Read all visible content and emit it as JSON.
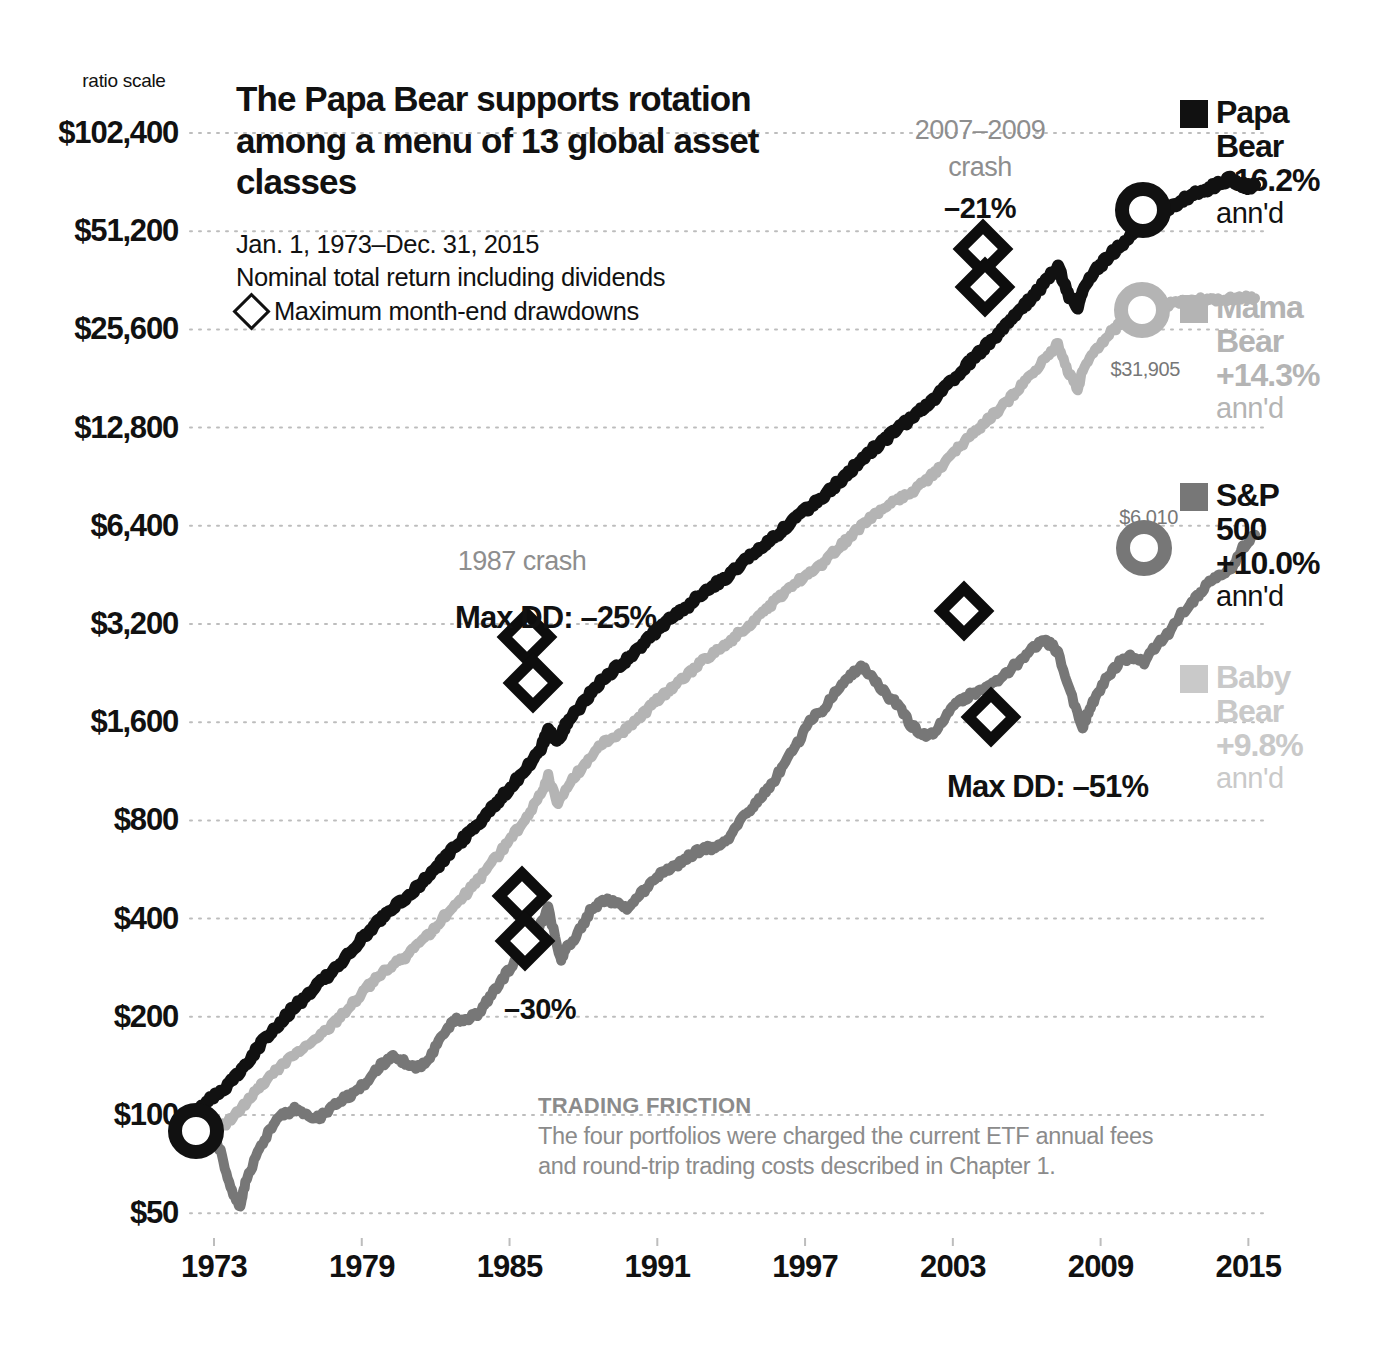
{
  "chart_data": {
    "type": "line",
    "title": "The Papa Bear supports rotation among a menu of 13 global asset classes",
    "subtitle_lines": [
      "Jan. 1, 1973–Dec. 31, 2015",
      "Nominal total return including dividends"
    ],
    "drawdown_key": "Maximum month-end drawdowns",
    "ratio_scale_label": "ratio scale",
    "xlabel": "",
    "ylabel": "",
    "grid": true,
    "log_scale": true,
    "ylim": [
      50,
      102400
    ],
    "xlim": [
      1973,
      2016
    ],
    "yticks": [
      "$102,400",
      "$51,200",
      "$25,600",
      "$12,800",
      "$6,400",
      "$3,200",
      "$1,600",
      "$800",
      "$400",
      "$200",
      "$100",
      "$50"
    ],
    "ytick_values": [
      102400,
      51200,
      25600,
      12800,
      6400,
      3200,
      1600,
      800,
      400,
      200,
      100,
      50
    ],
    "xticks": [
      "1973",
      "1979",
      "1985",
      "1991",
      "1997",
      "2003",
      "2009",
      "2015"
    ],
    "xtick_values": [
      1973,
      1979,
      1985,
      1991,
      1997,
      2003,
      2009,
      2015
    ],
    "legend_position": "right",
    "series": [
      {
        "name": "Papa Bear",
        "label_lines": [
          "Papa",
          "Bear"
        ],
        "annual_return": "+16.2%",
        "ann_suffix": "ann'd",
        "color": "#111111",
        "end_value": 71000,
        "end_value_label": "",
        "max_drawdown": "-25%",
        "x": [
          1973.0,
          1973.5,
          1974.0,
          1974.5,
          1975.0,
          1975.5,
          1976.0,
          1976.5,
          1977.0,
          1977.5,
          1978.0,
          1978.5,
          1979.0,
          1979.5,
          1980.0,
          1980.5,
          1981.0,
          1981.5,
          1982.0,
          1982.5,
          1983.0,
          1983.5,
          1984.0,
          1984.5,
          1985.0,
          1985.5,
          1986.0,
          1986.5,
          1987.0,
          1987.3,
          1987.7,
          1988.0,
          1988.5,
          1989.0,
          1989.5,
          1990.0,
          1990.5,
          1991.0,
          1991.5,
          1992.0,
          1992.5,
          1993.0,
          1993.5,
          1994.0,
          1994.5,
          1995.0,
          1995.5,
          1996.0,
          1996.5,
          1997.0,
          1997.5,
          1998.0,
          1998.5,
          1999.0,
          1999.5,
          2000.0,
          2000.5,
          2001.0,
          2001.5,
          2002.0,
          2002.5,
          2003.0,
          2003.5,
          2004.0,
          2004.5,
          2005.0,
          2005.5,
          2006.0,
          2006.5,
          2007.0,
          2007.5,
          2008.0,
          2008.4,
          2008.8,
          2009.0,
          2009.5,
          2010.0,
          2010.5,
          2011.0,
          2011.5,
          2012.0,
          2012.5,
          2013.0,
          2013.5,
          2014.0,
          2014.5,
          2015.0,
          2015.3,
          2015.7,
          2016.0
        ],
        "y": [
          100,
          112,
          118,
          128,
          142,
          160,
          178,
          196,
          214,
          232,
          252,
          274,
          300,
          330,
          365,
          400,
          432,
          462,
          500,
          545,
          600,
          660,
          720,
          790,
          870,
          960,
          1060,
          1180,
          1330,
          1500,
          1400,
          1560,
          1750,
          1950,
          2150,
          2320,
          2500,
          2720,
          2950,
          3200,
          3400,
          3650,
          3950,
          4200,
          4450,
          4800,
          5150,
          5550,
          5950,
          6400,
          6900,
          7400,
          7900,
          8600,
          9300,
          10200,
          11000,
          11800,
          12700,
          13600,
          14600,
          15800,
          17200,
          18800,
          20600,
          22500,
          24500,
          26800,
          29500,
          32500,
          36000,
          40000,
          33000,
          29500,
          33500,
          38500,
          42500,
          46000,
          50000,
          53000,
          56500,
          60000,
          63500,
          66500,
          68500,
          71500,
          74000,
          72000,
          70000,
          71000
        ]
      },
      {
        "name": "Mama Bear",
        "label_lines": [
          "Mama",
          "Bear"
        ],
        "annual_return": "+14.3%",
        "ann_suffix": "ann'd",
        "color": "#b4b4b4",
        "end_value": 31905,
        "end_value_label": "$31,905",
        "max_drawdown": "",
        "x": [
          1973.0,
          1973.5,
          1974.0,
          1974.5,
          1975.0,
          1975.5,
          1976.0,
          1976.5,
          1977.0,
          1977.5,
          1978.0,
          1978.5,
          1979.0,
          1979.5,
          1980.0,
          1980.5,
          1981.0,
          1981.5,
          1982.0,
          1982.5,
          1983.0,
          1983.5,
          1984.0,
          1984.5,
          1985.0,
          1985.5,
          1986.0,
          1986.5,
          1987.0,
          1987.3,
          1987.7,
          1988.0,
          1988.5,
          1989.0,
          1989.5,
          1990.0,
          1990.5,
          1991.0,
          1991.5,
          1992.0,
          1992.5,
          1993.0,
          1993.5,
          1994.0,
          1994.5,
          1995.0,
          1995.5,
          1996.0,
          1996.5,
          1997.0,
          1997.5,
          1998.0,
          1998.5,
          1999.0,
          1999.5,
          2000.0,
          2000.5,
          2001.0,
          2001.5,
          2002.0,
          2002.5,
          2003.0,
          2003.5,
          2004.0,
          2004.5,
          2005.0,
          2005.5,
          2006.0,
          2006.5,
          2007.0,
          2007.5,
          2008.0,
          2008.4,
          2008.8,
          2009.0,
          2009.5,
          2010.0,
          2010.5,
          2011.0,
          2011.5,
          2012.0,
          2012.5,
          2013.0,
          2013.5,
          2014.0,
          2014.5,
          2015.0,
          2015.5,
          2016.0
        ],
        "y": [
          100,
          96,
          92,
          98,
          108,
          120,
          132,
          142,
          152,
          162,
          175,
          188,
          205,
          225,
          248,
          270,
          288,
          305,
          330,
          360,
          400,
          440,
          480,
          530,
          590,
          660,
          740,
          840,
          960,
          1090,
          900,
          1000,
          1120,
          1250,
          1370,
          1450,
          1520,
          1650,
          1800,
          1950,
          2080,
          2250,
          2450,
          2600,
          2750,
          2980,
          3200,
          3480,
          3750,
          4050,
          4350,
          4650,
          4950,
          5400,
          5850,
          6400,
          6850,
          7250,
          7700,
          8100,
          8600,
          9300,
          10200,
          11200,
          12200,
          13200,
          14300,
          15600,
          17200,
          19000,
          21000,
          23200,
          19000,
          16800,
          19000,
          22000,
          24500,
          26500,
          28200,
          29000,
          29800,
          30500,
          31000,
          31400,
          31600,
          31800,
          31900,
          31905,
          31905
        ]
      },
      {
        "name": "S&P 500",
        "label_lines": [
          "S&P",
          "500"
        ],
        "annual_return": "+10.0%",
        "ann_suffix": "ann'd",
        "color": "#777777",
        "end_value": 6010,
        "end_value_label": "$6,010",
        "max_drawdown": "-51%",
        "x": [
          1973.0,
          1973.5,
          1974.0,
          1974.4,
          1974.8,
          1975.0,
          1975.5,
          1976.0,
          1976.5,
          1977.0,
          1977.5,
          1978.0,
          1978.5,
          1979.0,
          1979.5,
          1980.0,
          1980.5,
          1981.0,
          1981.5,
          1982.0,
          1982.5,
          1983.0,
          1983.5,
          1984.0,
          1984.5,
          1985.0,
          1985.5,
          1986.0,
          1986.5,
          1987.0,
          1987.3,
          1987.8,
          1988.0,
          1988.5,
          1989.0,
          1989.5,
          1990.0,
          1990.5,
          1991.0,
          1991.5,
          1992.0,
          1992.5,
          1993.0,
          1993.5,
          1994.0,
          1994.5,
          1995.0,
          1995.5,
          1996.0,
          1996.5,
          1997.0,
          1997.5,
          1998.0,
          1998.5,
          1999.0,
          1999.5,
          2000.0,
          2000.5,
          2001.0,
          2001.5,
          2002.0,
          2002.5,
          2003.0,
          2003.5,
          2004.0,
          2004.5,
          2005.0,
          2005.5,
          2006.0,
          2006.5,
          2007.0,
          2007.4,
          2007.8,
          2008.0,
          2008.5,
          2009.0,
          2009.2,
          2009.5,
          2010.0,
          2010.5,
          2011.0,
          2011.5,
          2012.0,
          2012.5,
          2013.0,
          2013.5,
          2014.0,
          2014.5,
          2015.0,
          2015.5,
          2016.0
        ],
        "y": [
          100,
          88,
          78,
          60,
          52,
          62,
          76,
          90,
          100,
          104,
          100,
          98,
          105,
          112,
          118,
          128,
          142,
          150,
          145,
          140,
          150,
          175,
          195,
          198,
          205,
          235,
          265,
          300,
          330,
          385,
          430,
          300,
          320,
          360,
          420,
          455,
          450,
          430,
          470,
          520,
          560,
          580,
          620,
          650,
          660,
          680,
          780,
          860,
          960,
          1060,
          1250,
          1400,
          1650,
          1750,
          2000,
          2200,
          2380,
          2200,
          1950,
          1820,
          1580,
          1450,
          1480,
          1700,
          1850,
          1950,
          2050,
          2150,
          2300,
          2480,
          2700,
          2850,
          2750,
          2600,
          2000,
          1520,
          1700,
          1900,
          2200,
          2450,
          2550,
          2450,
          2750,
          3000,
          3450,
          3750,
          4200,
          4450,
          4700,
          5500,
          6010
        ]
      },
      {
        "name": "Baby Bear",
        "label_lines": [
          "Baby",
          "Bear"
        ],
        "annual_return": "+9.8%",
        "ann_suffix": "ann'd",
        "color": "#c9c9c9",
        "end_value": 0,
        "end_value_label": "",
        "max_drawdown": "-30%",
        "x": [],
        "y": []
      }
    ],
    "annotations": [
      {
        "id": "crash-1987",
        "text": "1987 crash",
        "style": "grey",
        "x_px": 522,
        "y_px": 546
      },
      {
        "id": "maxdd-papa",
        "text": "Max DD: –25%",
        "style": "bold-lg",
        "x_px": 455,
        "y_px": 600
      },
      {
        "id": "crash-2007-2009-line1",
        "text": "2007–2009",
        "style": "grey",
        "x_px": 980,
        "y_px": 115
      },
      {
        "id": "crash-2007-2009-line2",
        "text": "crash",
        "style": "grey",
        "x_px": 980,
        "y_px": 152
      },
      {
        "id": "crash-2007-2009-pct",
        "text": "–21%",
        "style": "bold",
        "x_px": 980,
        "y_px": 192
      },
      {
        "id": "maxdd-baby",
        "text": "–30%",
        "style": "bold",
        "x_px": 540,
        "y_px": 993
      },
      {
        "id": "maxdd-sp500",
        "text": "Max DD: –51%",
        "style": "bold-lg",
        "x_px": 947,
        "y_px": 769
      }
    ],
    "drawdown_markers": [
      {
        "series": "Papa Bear",
        "x_px": 527,
        "y_px": 637
      },
      {
        "series": "Papa Bear",
        "x_px": 533,
        "y_px": 683
      },
      {
        "series": "Papa Bear",
        "x_px": 983,
        "y_px": 249
      },
      {
        "series": "Papa Bear",
        "x_px": 985,
        "y_px": 287
      },
      {
        "series": "Baby Bear",
        "x_px": 522,
        "y_px": 896
      },
      {
        "series": "Baby Bear",
        "x_px": 525,
        "y_px": 941
      },
      {
        "series": "S&P 500",
        "x_px": 964,
        "y_px": 611
      },
      {
        "series": "S&P 500",
        "x_px": 991,
        "y_px": 717
      }
    ],
    "endpoint_rings": [
      {
        "series": "Papa Bear",
        "x_px": 1143,
        "y_px": 210,
        "color": "#111111"
      },
      {
        "series": "Mama Bear",
        "x_px": 1142,
        "y_px": 310,
        "color": "#b4b4b4"
      },
      {
        "series": "S&P 500",
        "x_px": 1144,
        "y_px": 548,
        "color": "#777777"
      },
      {
        "series": "Start",
        "x_px": 196,
        "y_px": 1131,
        "color": "#111111"
      }
    ],
    "end_value_labels": [
      {
        "text": "$31,905",
        "x_px": 1180,
        "y_px": 358
      },
      {
        "text": "$6,010",
        "x_px": 1178,
        "y_px": 506
      }
    ]
  },
  "footnote": {
    "heading": "TRADING FRICTION",
    "body": "The four portfolios were charged the current ETF annual fees and round-trip trading costs described in Chapter 1."
  }
}
